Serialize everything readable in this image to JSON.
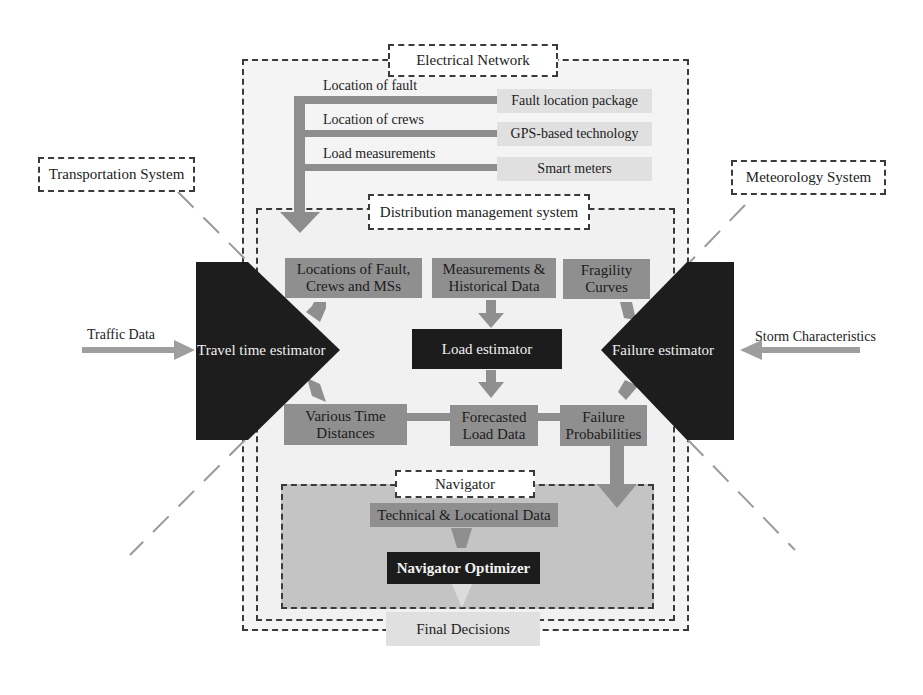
{
  "systems": {
    "electrical_network": "Electrical Network",
    "transportation_system": "Transportation System",
    "meteorology_system": "Meteorology System",
    "distribution_management_system": "Distribution management system",
    "navigator": "Navigator"
  },
  "electrical_inputs": [
    {
      "signal": "Location of fault",
      "source": "Fault location package"
    },
    {
      "signal": "Location of crews",
      "source": "GPS-based technology"
    },
    {
      "signal": "Load measurements",
      "source": "Smart meters"
    }
  ],
  "external_inputs": {
    "traffic": "Traffic Data",
    "storm": "Storm Characteristics"
  },
  "estimators": {
    "travel_time": "Travel time estimator",
    "load": "Load estimator",
    "failure": "Failure estimator"
  },
  "dms_inputs": {
    "locations": "Locations of Fault, Crews and MSs",
    "measurements": "Measurements & Historical Data",
    "fragility": "Fragility Curves"
  },
  "dms_outputs": {
    "time_distances": "Various Time Distances",
    "forecasted_load": "Forecasted Load Data",
    "failure_prob": "Failure Probabilities"
  },
  "navigator_blocks": {
    "technical_data": "Technical & Locational Data",
    "optimizer": "Navigator Optimizer",
    "final": "Final Decisions"
  },
  "colors": {
    "dark_block": "#1c1c1c",
    "gray_box": "#8f8f8f",
    "arrow": "#999999",
    "panel_bg": "#f3f3f3",
    "navigator_bg": "#c4c4c4"
  }
}
